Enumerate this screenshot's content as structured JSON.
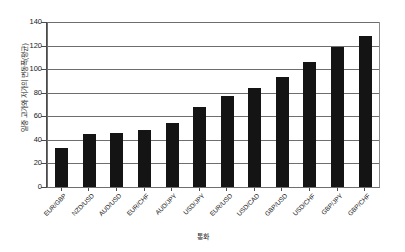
{
  "chart_data": {
    "type": "bar",
    "title": "",
    "xlabel": "통화",
    "ylabel": "일중 고가와 저가의 변동폭(평균)",
    "categories": [
      "EUR/GBP",
      "NZD/USD",
      "AUD/USD",
      "EUR/CHF",
      "AUD/JPY",
      "USD/JPY",
      "EUR/USD",
      "USD/CAD",
      "GBP/USD",
      "USD/CHF",
      "GBP/JPY",
      "GBP/CHF"
    ],
    "values": [
      33,
      45,
      46,
      48,
      54,
      68,
      77,
      84,
      93,
      106,
      119,
      128
    ],
    "ylim": [
      0,
      140
    ],
    "ytick_labels": [
      "0",
      "20",
      "40",
      "60",
      "80",
      "100",
      "120",
      "140"
    ],
    "ytick_values": [
      0,
      20,
      40,
      60,
      80,
      100,
      120,
      140
    ],
    "grid": true,
    "legend": false,
    "bar_color": "#141414",
    "grid_color": "#6e6e6e",
    "axis_color": "#4a4a4a",
    "background": "#ffffff"
  }
}
